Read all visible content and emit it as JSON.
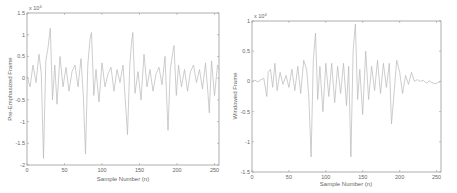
{
  "chart_data": [
    {
      "type": "line",
      "title": "",
      "xlabel": "Sample Number (n)",
      "ylabel": "Pre-Emphasized Frame",
      "y_exponent": "x 10^4",
      "xlim": [
        0,
        256
      ],
      "ylim": [
        -2,
        1.5
      ],
      "xticks": [
        0,
        50,
        100,
        150,
        200,
        250
      ],
      "yticks": [
        -2,
        -1.5,
        -1,
        -0.5,
        0,
        0.5,
        1,
        1.5
      ],
      "ytick_labels": [
        "-2",
        "-1.5",
        "-1",
        "-0.5",
        "0",
        "0.5",
        "1",
        "1.5"
      ],
      "grid": false,
      "line_color": "#b8b8b8",
      "x": [
        0,
        4,
        8,
        12,
        16,
        19,
        22,
        25,
        28,
        31,
        34,
        37,
        40,
        44,
        48,
        52,
        56,
        60,
        64,
        68,
        72,
        75,
        78,
        81,
        84,
        86,
        89,
        92,
        96,
        100,
        104,
        108,
        112,
        116,
        120,
        124,
        128,
        131,
        134,
        137,
        139,
        141,
        144,
        148,
        152,
        156,
        160,
        164,
        168,
        172,
        176,
        180,
        184,
        188,
        191,
        194,
        196,
        199,
        202,
        206,
        210,
        214,
        218,
        222,
        226,
        230,
        234,
        238,
        241,
        243,
        246,
        250,
        254,
        256
      ],
      "y": [
        0.05,
        -0.2,
        0.3,
        -0.1,
        0.55,
        0.1,
        -1.85,
        0.4,
        0.7,
        1.15,
        -0.5,
        0.3,
        -0.6,
        0.5,
        -0.2,
        0.25,
        -0.3,
        0.15,
        0.3,
        -0.2,
        0.45,
        -0.4,
        -1.75,
        0.3,
        0.9,
        1.05,
        -0.4,
        0.2,
        -0.55,
        0.35,
        -0.2,
        0.1,
        0.25,
        -0.3,
        0.2,
        -0.1,
        0.3,
        -0.5,
        -1.3,
        0.3,
        0.75,
        1.05,
        -0.35,
        0.15,
        -0.5,
        0.55,
        -0.2,
        0.2,
        -0.3,
        0.1,
        0.25,
        -0.15,
        0.5,
        -1.2,
        0.2,
        0.55,
        0.75,
        -0.4,
        0.3,
        -0.2,
        0.2,
        -0.3,
        0.15,
        0.3,
        -0.1,
        0.2,
        -0.25,
        0.35,
        -0.3,
        -0.8,
        0.4,
        -0.4,
        0.3,
        0.2
      ]
    },
    {
      "type": "line",
      "title": "",
      "xlabel": "Sample Number (n)",
      "ylabel": "Windowed Frame",
      "y_exponent": "x 10^4",
      "xlim": [
        0,
        256
      ],
      "ylim": [
        -1.5,
        1
      ],
      "xticks": [
        0,
        50,
        100,
        150,
        200,
        250
      ],
      "yticks": [
        -1.5,
        -1,
        -0.5,
        0,
        0.5,
        1
      ],
      "ytick_labels": [
        "-1.5",
        "-1",
        "-0.5",
        "0",
        "0.5",
        "1"
      ],
      "grid": false,
      "line_color": "#b8b8b8",
      "x": [
        0,
        4,
        8,
        12,
        16,
        20,
        22,
        25,
        28,
        31,
        34,
        38,
        42,
        46,
        50,
        54,
        58,
        62,
        66,
        70,
        74,
        77,
        80,
        83,
        86,
        89,
        92,
        96,
        100,
        104,
        108,
        112,
        116,
        120,
        124,
        128,
        131,
        134,
        137,
        140,
        143,
        146,
        150,
        154,
        158,
        162,
        166,
        170,
        174,
        178,
        182,
        186,
        189,
        192,
        196,
        200,
        204,
        208,
        212,
        216,
        220,
        224,
        228,
        232,
        236,
        240,
        244,
        248,
        252,
        256
      ],
      "y": [
        0,
        0.02,
        -0.01,
        0.03,
        0.05,
        -0.25,
        0.15,
        0.2,
        -0.1,
        0.3,
        -0.15,
        0.15,
        -0.05,
        0.1,
        -0.1,
        0.2,
        -0.15,
        0.25,
        -0.2,
        0.35,
        0.2,
        -0.25,
        -1.25,
        0.35,
        0.8,
        -0.3,
        0.25,
        -0.5,
        0.3,
        -0.25,
        0.3,
        -0.35,
        0.25,
        -0.2,
        0.3,
        -0.4,
        0.25,
        -1.25,
        0.5,
        0.95,
        -0.3,
        0.2,
        -0.55,
        0.5,
        -0.3,
        0.25,
        -0.15,
        0.35,
        -0.2,
        0.3,
        -0.1,
        0.3,
        -0.7,
        -0.25,
        0.35,
        0.15,
        -0.2,
        0.1,
        -0.05,
        0.15,
        0.0,
        0.03,
        0.0,
        0.02,
        -0.03,
        0.01,
        -0.02,
        -0.04,
        -0.02,
        0.0
      ]
    }
  ],
  "panels": {
    "left": {
      "ylabel": "Pre-Emphasized Frame",
      "xlabel": "Sample Number (n)",
      "exponent": "x 10",
      "exponent_power": "4"
    },
    "right": {
      "ylabel": "Windowed Frame",
      "xlabel": "Sample Number (n)",
      "exponent": "x 10",
      "exponent_power": "4"
    }
  }
}
